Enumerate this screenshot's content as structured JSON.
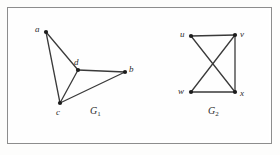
{
  "figure": {
    "background_color": "#fdfdfc",
    "frame_color": "#8d8d8d",
    "edge_color": "#3a3a3a",
    "vertex_color": "#1c1c1c",
    "label_color": "#2b2b2b",
    "width": 280,
    "height": 155
  },
  "graphs": [
    {
      "id": "G1",
      "caption_base": "G",
      "caption_sub": "1",
      "caption_x": 90,
      "caption_y": 106,
      "vertices": [
        {
          "id": "a",
          "label": "a",
          "x": 46,
          "y": 32,
          "label_x": 35,
          "label_y": 25
        },
        {
          "id": "d",
          "label": "d",
          "x": 78,
          "y": 70,
          "label_x": 74,
          "label_y": 58
        },
        {
          "id": "b",
          "label": "b",
          "x": 125,
          "y": 72,
          "label_x": 129,
          "label_y": 65
        },
        {
          "id": "c",
          "label": "c",
          "x": 60,
          "y": 103,
          "label_x": 56,
          "label_y": 108
        }
      ],
      "edges": [
        {
          "from": "a",
          "to": "c"
        },
        {
          "from": "a",
          "to": "d"
        },
        {
          "from": "c",
          "to": "d"
        },
        {
          "from": "d",
          "to": "b"
        },
        {
          "from": "c",
          "to": "b"
        }
      ]
    },
    {
      "id": "G2",
      "caption_base": "G",
      "caption_sub": "2",
      "caption_x": 208,
      "caption_y": 106,
      "vertices": [
        {
          "id": "u",
          "label": "u",
          "x": 191,
          "y": 36,
          "label_x": 180,
          "label_y": 30
        },
        {
          "id": "v",
          "label": "v",
          "x": 235,
          "y": 35,
          "label_x": 240,
          "label_y": 30
        },
        {
          "id": "w",
          "label": "w",
          "x": 191,
          "y": 92,
          "label_x": 178,
          "label_y": 87
        },
        {
          "id": "x",
          "label": "x",
          "x": 235,
          "y": 92,
          "label_x": 240,
          "label_y": 89
        }
      ],
      "edges": [
        {
          "from": "u",
          "to": "v"
        },
        {
          "from": "u",
          "to": "x"
        },
        {
          "from": "v",
          "to": "w"
        },
        {
          "from": "v",
          "to": "x"
        },
        {
          "from": "w",
          "to": "x"
        }
      ]
    }
  ]
}
